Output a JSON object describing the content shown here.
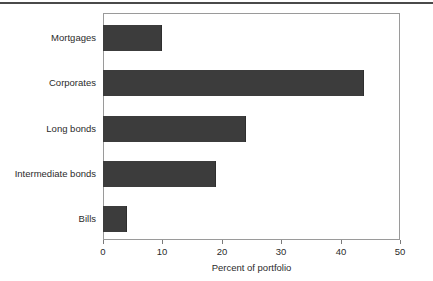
{
  "figure": {
    "width": 433,
    "height": 281,
    "background_color": "#ffffff",
    "top_rule_color": "#4a4a4a",
    "frame_color": "#9a9a9a"
  },
  "chart_data": {
    "type": "bar",
    "orientation": "horizontal",
    "title": "",
    "subtitle": "",
    "xlabel": "Percent of portfolio",
    "ylabel": "",
    "categories": [
      "Mortgages",
      "Corporates",
      "Long bonds",
      "Intermediate bonds",
      "Bills"
    ],
    "values": [
      10,
      44,
      24,
      19,
      4
    ],
    "xlim": [
      0,
      50
    ],
    "xticks": [
      0,
      10,
      20,
      30,
      40,
      50
    ],
    "xtick_labels": [
      "0",
      "10",
      "20",
      "30",
      "40",
      "50"
    ],
    "grid": false,
    "legend": null,
    "bar_color": "#3c3c3c",
    "annotations": []
  }
}
